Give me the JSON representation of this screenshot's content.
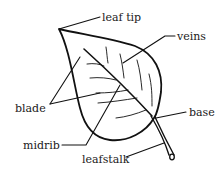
{
  "diagram": {
    "subject": "leaf",
    "labels": {
      "leaf_tip": "leaf tip",
      "veins": "veins",
      "blade": "blade",
      "base": "base",
      "midrib": "midrib",
      "leafstalk": "leafstalk"
    }
  }
}
